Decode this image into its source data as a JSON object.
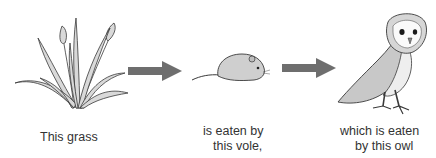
{
  "diagram": {
    "type": "food_chain",
    "nodes": [
      {
        "id": "grass",
        "label": "This grass",
        "icon": "grass-icon"
      },
      {
        "id": "vole",
        "label_line1": "is eaten by",
        "label_line2": "this vole,",
        "icon": "vole-icon"
      },
      {
        "id": "owl",
        "label_line1": "which is eaten",
        "label_line2": "by this owl",
        "icon": "owl-icon"
      }
    ],
    "edges": [
      {
        "from": "grass",
        "to": "vole",
        "icon": "arrow-right-icon"
      },
      {
        "from": "vole",
        "to": "owl",
        "icon": "arrow-right-icon"
      }
    ],
    "colors": {
      "arrow": "#6e6e6e",
      "line": "#3a3a3a",
      "fill": "#d8d8d8"
    }
  }
}
